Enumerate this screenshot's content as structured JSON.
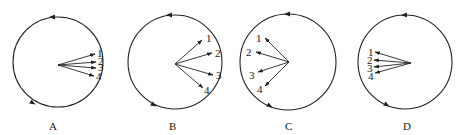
{
  "figure": {
    "panels": [
      {
        "label": "A",
        "circle": {
          "cx": 58,
          "cy": 62,
          "r": 45
        },
        "origin": {
          "x": 58,
          "y": 65
        },
        "arrows": [
          {
            "id": "1",
            "tip": {
              "x": 95,
              "y": 54
            },
            "num": {
              "x": 97,
              "y": 57
            }
          },
          {
            "id": "2",
            "tip": {
              "x": 96,
              "y": 62
            },
            "num": {
              "x": 98,
              "y": 65
            }
          },
          {
            "id": "3",
            "tip": {
              "x": 96,
              "y": 68
            },
            "num": {
              "x": 98,
              "y": 71
            }
          },
          {
            "id": "4",
            "tip": {
              "x": 94,
              "y": 76
            },
            "num": {
              "x": 96,
              "y": 80
            }
          }
        ],
        "dir_markers": [
          {
            "x": 52,
            "y": 17,
            "angle": 180
          },
          {
            "x": 33,
            "y": 103,
            "angle": 30
          }
        ],
        "label_pos": {
          "x": 49,
          "y": 130
        }
      },
      {
        "label": "B",
        "circle": {
          "cx": 175,
          "cy": 62,
          "r": 47
        },
        "origin": {
          "x": 175,
          "y": 64
        },
        "arrows": [
          {
            "id": "1",
            "tip": {
              "x": 202,
              "y": 40
            },
            "num": {
              "x": 206,
              "y": 42
            }
          },
          {
            "id": "2",
            "tip": {
              "x": 212,
              "y": 53
            },
            "num": {
              "x": 215,
              "y": 57
            }
          },
          {
            "id": "3",
            "tip": {
              "x": 213,
              "y": 75
            },
            "num": {
              "x": 216,
              "y": 79
            }
          },
          {
            "id": "4",
            "tip": {
              "x": 203,
              "y": 88
            },
            "num": {
              "x": 204,
              "y": 94
            }
          }
        ],
        "dir_markers": [
          {
            "x": 169,
            "y": 15,
            "angle": 180
          },
          {
            "x": 154,
            "y": 105,
            "angle": 30
          }
        ],
        "label_pos": {
          "x": 169,
          "y": 130
        }
      },
      {
        "label": "C",
        "circle": {
          "cx": 288,
          "cy": 62,
          "r": 48
        },
        "origin": {
          "x": 289,
          "y": 62
        },
        "arrows": [
          {
            "id": "1",
            "tip": {
              "x": 265,
              "y": 38
            },
            "num": {
              "x": 256,
              "y": 42
            }
          },
          {
            "id": "2",
            "tip": {
              "x": 256,
              "y": 52
            },
            "num": {
              "x": 246,
              "y": 56
            }
          },
          {
            "id": "3",
            "tip": {
              "x": 258,
              "y": 72
            },
            "num": {
              "x": 249,
              "y": 79
            }
          },
          {
            "id": "4",
            "tip": {
              "x": 265,
              "y": 86
            },
            "num": {
              "x": 257,
              "y": 93
            }
          }
        ],
        "dir_markers": [
          {
            "x": 287,
            "y": 14,
            "angle": 180
          },
          {
            "x": 270,
            "y": 106,
            "angle": 30
          }
        ],
        "label_pos": {
          "x": 285,
          "y": 130
        }
      },
      {
        "label": "D",
        "circle": {
          "cx": 405,
          "cy": 62,
          "r": 47
        },
        "origin": {
          "x": 411,
          "y": 63
        },
        "arrows": [
          {
            "id": "1",
            "tip": {
              "x": 375,
              "y": 52
            },
            "num": {
              "x": 368,
              "y": 56
            }
          },
          {
            "id": "2",
            "tip": {
              "x": 374,
              "y": 60
            },
            "num": {
              "x": 367,
              "y": 64
            }
          },
          {
            "id": "3",
            "tip": {
              "x": 374,
              "y": 67
            },
            "num": {
              "x": 367,
              "y": 72
            }
          },
          {
            "id": "4",
            "tip": {
              "x": 375,
              "y": 73
            },
            "num": {
              "x": 368,
              "y": 80
            }
          }
        ],
        "dir_markers": [
          {
            "x": 404,
            "y": 15,
            "angle": 180
          },
          {
            "x": 387,
            "y": 105,
            "angle": 30
          }
        ],
        "label_pos": {
          "x": 403,
          "y": 130
        }
      }
    ],
    "colors": {
      "stroke": "#222222",
      "background": "#ffffff"
    }
  }
}
